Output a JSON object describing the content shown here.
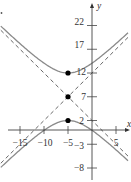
{
  "chart_data": {
    "type": "line",
    "title": "",
    "xlabel": "x",
    "ylabel": "y",
    "xlim": [
      -19,
      8
    ],
    "ylim": [
      -10.5,
      24.5
    ],
    "grid": false,
    "x_ticks": [
      -15,
      -10,
      -5,
      5
    ],
    "x_tick_labels": [
      "−15",
      "−10",
      "−5",
      "5"
    ],
    "y_ticks": [
      22,
      17,
      12,
      7,
      2,
      -3,
      -8
    ],
    "y_tick_labels": [
      "22",
      "17",
      "12",
      "7",
      "2",
      "−3",
      "−8"
    ],
    "center": {
      "x": -5,
      "y": 7
    },
    "a": 5,
    "b": 5,
    "equation": "(y-7)^2/25 - (x+5)^2/25 = 1",
    "series": [
      {
        "name": "hyperbola upper branch",
        "style": "solid",
        "color": "#888888"
      },
      {
        "name": "hyperbola lower branch",
        "style": "solid",
        "color": "#888888"
      },
      {
        "name": "asymptote y = x + 12",
        "style": "dashed",
        "color": "#555555"
      },
      {
        "name": "asymptote y = -x + 2",
        "style": "dashed",
        "color": "#555555"
      }
    ],
    "points": [
      {
        "label": "upper vertex",
        "x": -5,
        "y": 12
      },
      {
        "label": "center",
        "x": -5,
        "y": 7
      },
      {
        "label": "lower vertex",
        "x": -5,
        "y": 2
      }
    ]
  },
  "labels": {
    "x_axis": "x",
    "y_axis": "y",
    "xt": [
      "−15",
      "−10",
      "−5",
      "5"
    ],
    "yt": [
      "22",
      "17",
      "12",
      "7",
      "2",
      "−3",
      "−8"
    ]
  }
}
